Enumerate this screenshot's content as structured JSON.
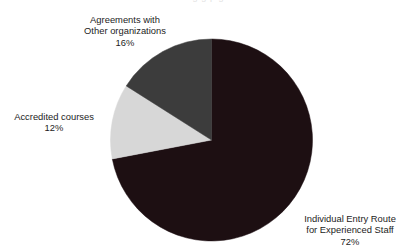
{
  "page": {
    "clipped_header_fragment": "o g g p g"
  },
  "chart_data": {
    "type": "pie",
    "title": "",
    "subtitle": "",
    "xlabel": "",
    "ylabel": "",
    "legend_position": "none",
    "grid": false,
    "labels_outside": true,
    "start_angle_deg": 0,
    "direction": "clockwise",
    "categories": [
      "Individual Entry Route for Experienced Staff",
      "Agreements with Other organizations",
      "Accredited courses"
    ],
    "values": [
      72,
      16,
      12
    ],
    "value_suffix": "%",
    "colors": [
      "#1d0f12",
      "#3c3c3c",
      "#d7d7d7"
    ],
    "slices": [
      {
        "name": "individual-entry-route",
        "label_line1": "Individual Entry Route",
        "label_line2": "for Experienced Staff",
        "value": 72,
        "value_text": "72%",
        "color": "#1d0f12",
        "start_deg": 0,
        "sweep_deg": 259.2
      },
      {
        "name": "accredited-courses",
        "label_line1": "Accredited courses",
        "label_line2": "",
        "value": 12,
        "value_text": "12%",
        "color": "#d7d7d7",
        "start_deg": 259.2,
        "sweep_deg": 43.2
      },
      {
        "name": "agreements-other-organizations",
        "label_line1": "Agreements with",
        "label_line2": "Other organizations",
        "value": 16,
        "value_text": "16%",
        "color": "#3c3c3c",
        "start_deg": 302.4,
        "sweep_deg": 57.6
      }
    ]
  },
  "geometry": {
    "center_x": 211.5,
    "center_y": 140,
    "radius": 101
  }
}
